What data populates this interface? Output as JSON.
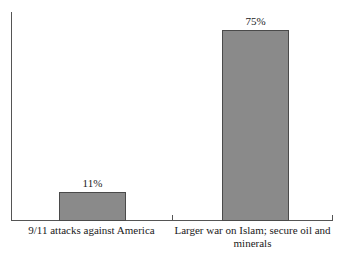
{
  "chart_data": {
    "type": "bar",
    "title": "",
    "subtitle": "",
    "xlabel": "",
    "ylabel": "",
    "categories": [
      "9/11 attacks against America",
      "Larger war on Islam; secure oil and minerals"
    ],
    "values": [
      11,
      75
    ],
    "value_labels": [
      "11%",
      "75%"
    ],
    "ylim": [
      0,
      82
    ],
    "grid": false,
    "legend": null,
    "series": [
      {
        "name": "",
        "values": [
          11,
          75
        ]
      }
    ],
    "annotations": []
  },
  "category_label_lines": {
    "first": [
      "9/11 attacks against America"
    ],
    "second": [
      "Larger war on Islam; secure oil and",
      "minerals"
    ]
  },
  "colors": {
    "bar_fill": "#8a8a8a",
    "bar_border": "#4a4a4a",
    "axis": "#555555",
    "text": "#1a1a1a",
    "background": "#ffffff"
  }
}
